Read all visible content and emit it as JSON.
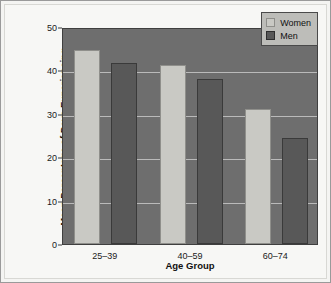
{
  "chart_data": {
    "type": "bar",
    "title": "",
    "categories": [
      "25–39",
      "40–59",
      "60–74"
    ],
    "series": [
      {
        "name": "Women",
        "values": [
          44.8,
          41.2,
          31.0
        ],
        "color": "#c9c9c4"
      },
      {
        "name": "Men",
        "values": [
          41.8,
          38.0,
          24.5
        ],
        "color": "#585858"
      }
    ],
    "xlabel": "Age Group",
    "ylabel": "Mean Percentage of Days Experiencing Daily Stressors",
    "ylabel_line1": "Mean Percentage of Days Experiencing",
    "ylabel_line2": "Daily Stressors",
    "ylim": [
      0,
      50
    ],
    "yticks": [
      0,
      10,
      20,
      30,
      40,
      50
    ],
    "ytick_labels": [
      "0",
      "10",
      "20",
      "30",
      "40",
      "50"
    ],
    "grid": true,
    "legend_position": "top-right",
    "plot_background": "#6e6e6e",
    "gridline_color": "#c8c8c8"
  },
  "legend": {
    "entries": [
      {
        "label": "Women",
        "swatch": "legend-swatch-women"
      },
      {
        "label": "Men",
        "swatch": "legend-swatch-men"
      }
    ]
  },
  "axis": {
    "x_title": "Age Group",
    "y_title_line1": "Mean Percentage of Days Experiencing",
    "y_title_line2": "Daily Stressors",
    "y_tick_0": "0",
    "y_tick_1": "10",
    "y_tick_2": "20",
    "y_tick_3": "30",
    "y_tick_4": "40",
    "y_tick_5": "50",
    "x_tick_0": "25–39",
    "x_tick_1": "40–59",
    "x_tick_2": "60–74"
  }
}
